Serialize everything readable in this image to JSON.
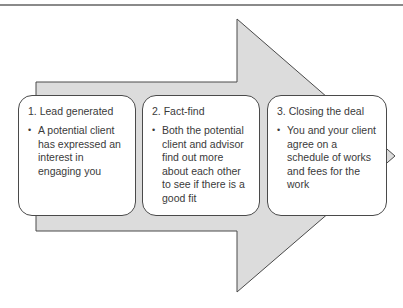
{
  "diagram": {
    "type": "process-arrow",
    "arrow": {
      "fill": "#dcdcdc",
      "stroke": "#4a4a4a"
    },
    "steps": [
      {
        "title": "1. Lead generated",
        "bullet": "A potential client has expressed an interest in engaging you"
      },
      {
        "title": "2. Fact-find",
        "bullet": "Both the potential client and advisor find out more about each other to see if there is a good fit"
      },
      {
        "title": "3. Closing the deal",
        "bullet": "You and your client agree on a schedule of works and fees for the work"
      }
    ],
    "bullet_symbol": "•"
  }
}
